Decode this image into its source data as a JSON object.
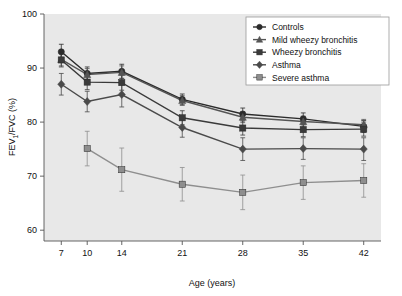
{
  "chart_data": {
    "type": "line",
    "title": "",
    "xlabel": "Age (years)",
    "ylabel": "FEV1/FVC (%)",
    "ylabel_parts": {
      "pre": "FEV",
      "sub": "1",
      "post": "/FVC (%)"
    },
    "x": [
      7,
      10,
      14,
      21,
      28,
      35,
      42
    ],
    "xtick_labels": [
      "7",
      "10",
      "14",
      "21",
      "28",
      "35",
      "42"
    ],
    "ytick_labels": [
      "60",
      "70",
      "80",
      "90",
      "100"
    ],
    "yticks": [
      60,
      70,
      80,
      90,
      100
    ],
    "xlim": [
      5,
      44
    ],
    "ylim": [
      58,
      100
    ],
    "grid": false,
    "legend_position": "top-right",
    "plot_background": "#e8e8e8",
    "series": [
      {
        "name": "Controls",
        "marker": "circle",
        "color": "#2b2b2b",
        "x": [
          7,
          10,
          14,
          21,
          28,
          35,
          42
        ],
        "values": [
          93.0,
          89.0,
          89.4,
          84.2,
          81.5,
          80.6,
          79.2
        ],
        "err_low": [
          1.4,
          1.2,
          1.3,
          1.0,
          1.1,
          1.1,
          1.1
        ],
        "err_high": [
          1.4,
          1.2,
          1.3,
          1.0,
          1.1,
          1.1,
          1.1
        ]
      },
      {
        "name": "Mild wheezy bronchitis",
        "marker": "triangle",
        "color": "#555555",
        "x": [
          7,
          10,
          14,
          21,
          28,
          35,
          42
        ],
        "values": [
          91.6,
          88.8,
          89.2,
          84.0,
          80.9,
          80.1,
          79.5
        ],
        "err_low": [
          1.2,
          1.1,
          1.2,
          0.9,
          1.0,
          1.0,
          1.0
        ],
        "err_high": [
          1.2,
          1.1,
          1.2,
          0.9,
          1.0,
          1.0,
          1.0
        ]
      },
      {
        "name": "Wheezy bronchitis",
        "marker": "square",
        "color": "#3a3a3a",
        "x": [
          7,
          10,
          14,
          21,
          28,
          35,
          42
        ],
        "values": [
          91.5,
          87.4,
          87.3,
          80.8,
          78.9,
          78.6,
          78.7
        ],
        "err_low": [
          1.3,
          1.4,
          1.4,
          1.3,
          1.3,
          1.3,
          1.3
        ],
        "err_high": [
          1.3,
          1.4,
          1.4,
          1.3,
          1.3,
          1.3,
          1.3
        ]
      },
      {
        "name": "Asthma",
        "marker": "diamond",
        "color": "#4a4a4a",
        "x": [
          7,
          10,
          14,
          21,
          28,
          35,
          42
        ],
        "values": [
          87.0,
          83.8,
          85.1,
          79.0,
          75.0,
          75.1,
          75.0
        ],
        "err_low": [
          2.0,
          1.9,
          2.3,
          1.8,
          2.1,
          2.0,
          2.1
        ],
        "err_high": [
          2.0,
          1.9,
          2.3,
          1.8,
          2.1,
          2.0,
          2.1
        ]
      },
      {
        "name": "Severe asthma",
        "marker": "square",
        "color": "#8e8e8e",
        "x": [
          10,
          14,
          21,
          28,
          35,
          42
        ],
        "values": [
          75.1,
          71.2,
          68.5,
          67.0,
          68.8,
          69.2
        ],
        "err_low": [
          3.2,
          4.0,
          3.1,
          3.2,
          3.1,
          3.1
        ],
        "err_high": [
          3.2,
          4.0,
          3.1,
          3.2,
          3.1,
          3.1
        ]
      }
    ]
  },
  "axes": {
    "x_title": "Age (years)",
    "y_title_pre": "FEV",
    "y_title_sub": "1",
    "y_title_post": "/FVC (%)"
  },
  "legend": {
    "items": [
      {
        "label": "Controls",
        "marker": "circle-marker",
        "color": "#2b2b2b"
      },
      {
        "label": "Mild wheezy bronchitis",
        "marker": "triangle-marker",
        "color": "#555555"
      },
      {
        "label": "Wheezy bronchitis",
        "marker": "square-marker",
        "color": "#3a3a3a"
      },
      {
        "label": "Asthma",
        "marker": "diamond-marker",
        "color": "#4a4a4a"
      },
      {
        "label": "Severe asthma",
        "marker": "square-marker",
        "color": "#8e8e8e"
      }
    ]
  }
}
